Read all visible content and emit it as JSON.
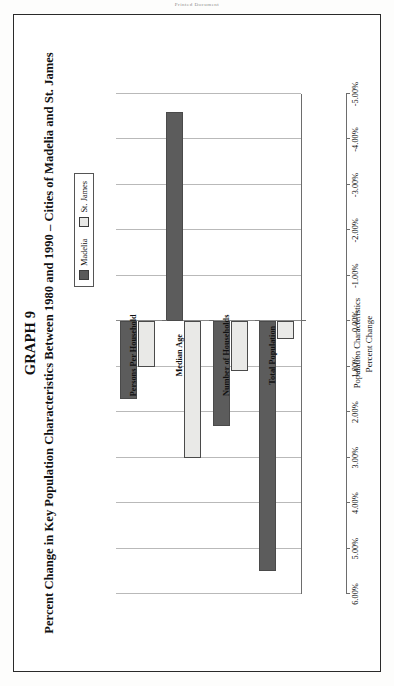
{
  "page": {
    "header_text": "Printed Document"
  },
  "figure": {
    "title": "GRAPH 9",
    "subtitle": "Percent Change in Key Population Characteristics Between 1980 and 1990 – Cities of Madelia and St. James"
  },
  "legend": {
    "position": "top-right",
    "entries": [
      {
        "label": "Madelia",
        "color": "#5c5c5c"
      },
      {
        "label": "St. James",
        "color": "#e9e9e7"
      }
    ]
  },
  "axes": {
    "value_axis_title": "Percent Change",
    "category_axis_title": "Population Characteristics"
  },
  "chart_data": {
    "type": "bar",
    "orientation": "vertical-printed-sideways",
    "title": "GRAPH 9",
    "subtitle": "Percent Change in Key Population Characteristics Between 1980 and 1990 – Cities of Madelia and St. James",
    "xlabel": "Population Characteristics",
    "ylabel": "Percent Change",
    "categories": [
      "Total Population",
      "Number of Households",
      "Median Age",
      "Persons Per Household"
    ],
    "series": [
      {
        "name": "Madelia",
        "color": "#5c5c5c",
        "values": [
          5.5,
          2.3,
          -4.6,
          1.7
        ]
      },
      {
        "name": "St. James",
        "color": "#e9e9e7",
        "values": [
          0.4,
          1.1,
          3.0,
          1.0
        ]
      }
    ],
    "ylim": [
      -5.0,
      6.0
    ],
    "ticks": [
      6.0,
      5.0,
      4.0,
      3.0,
      2.0,
      1.0,
      0.0,
      -1.0,
      -2.0,
      -3.0,
      -4.0,
      -5.0
    ],
    "tick_labels": [
      "6.00%",
      "5.00%",
      "4.00%",
      "3.00%",
      "2.00%",
      "1.00%",
      "0.00%",
      "-1.00%",
      "-2.00%",
      "-3.00%",
      "-4.00%",
      "-5.00%"
    ],
    "grid": true,
    "legend_position": "top-right"
  }
}
